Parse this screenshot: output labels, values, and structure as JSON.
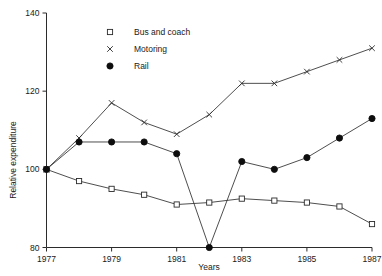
{
  "chart_data": {
    "type": "line",
    "title": "",
    "xlabel": "Years",
    "ylabel": "Relative expenditure",
    "xlim": [
      1977,
      1987
    ],
    "ylim": [
      80,
      140
    ],
    "ytick_values": [
      80,
      100,
      120,
      140
    ],
    "ytick_labels": [
      "80",
      "100",
      "120",
      "140"
    ],
    "xtick_values": [
      1977,
      1979,
      1981,
      1983,
      1985,
      1987
    ],
    "xtick_labels": [
      "1977",
      "1979",
      "1981",
      "1983",
      "1985",
      "1987"
    ],
    "grid": false,
    "legend_position": "top-center",
    "x": [
      1977,
      1978,
      1979,
      1980,
      1981,
      1982,
      1983,
      1984,
      1985,
      1986,
      1987
    ],
    "series": [
      {
        "name": "Bus and coach",
        "marker": "open-square",
        "values": [
          100,
          97,
          95,
          93.5,
          91,
          91.5,
          92.5,
          92,
          91.5,
          90.5,
          86
        ]
      },
      {
        "name": "Motoring",
        "marker": "cross",
        "values": [
          100,
          108,
          117,
          112,
          109,
          114,
          122,
          122,
          125,
          128,
          131
        ]
      },
      {
        "name": "Rail",
        "marker": "filled-circle",
        "values": [
          100,
          107,
          107,
          107,
          104,
          80,
          102,
          100,
          103,
          108,
          113
        ]
      }
    ]
  },
  "legend": {
    "items": [
      {
        "label": "Bus and coach",
        "marker": "open-square"
      },
      {
        "label": "Motoring",
        "marker": "cross"
      },
      {
        "label": "Rail",
        "marker": "filled-circle"
      }
    ]
  },
  "axes": {
    "y_title": "Relative expenditure",
    "x_title": "Years"
  }
}
